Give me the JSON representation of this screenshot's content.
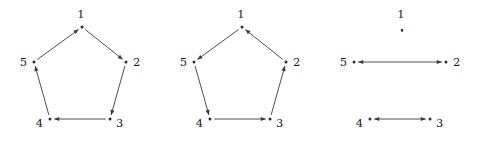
{
  "figure": {
    "width": 481,
    "height": 152,
    "background": "#ffffff",
    "ink_color": "#3a3a3a",
    "label_color": "#1a1a1a"
  },
  "panels": [
    {
      "id": "panel-left",
      "name": "directed-cycle-forward",
      "x": 0,
      "nodes": [
        {
          "id": "1",
          "label": "1",
          "cx": 82,
          "cy": 27,
          "label_dx": -1,
          "label_dy": -12,
          "anchor": "middle"
        },
        {
          "id": "2",
          "label": "2",
          "cx": 126,
          "cy": 62,
          "label_dx": 7,
          "label_dy": 1,
          "anchor": "start"
        },
        {
          "id": "3",
          "label": "3",
          "cx": 110,
          "cy": 119,
          "label_dx": 6,
          "label_dy": 5,
          "anchor": "start"
        },
        {
          "id": "4",
          "label": "4",
          "cx": 50,
          "cy": 119,
          "label_dx": -7,
          "label_dy": 5,
          "anchor": "end"
        },
        {
          "id": "5",
          "label": "5",
          "cx": 34,
          "cy": 62,
          "label_dx": -7,
          "label_dy": 1,
          "anchor": "end"
        }
      ],
      "edges": [
        {
          "from": "1",
          "to": "2",
          "arrow_at": "to"
        },
        {
          "from": "2",
          "to": "3",
          "arrow_at": "to"
        },
        {
          "from": "3",
          "to": "4",
          "arrow_at": "to"
        },
        {
          "from": "4",
          "to": "5",
          "arrow_at": "to"
        },
        {
          "from": "5",
          "to": "1",
          "arrow_at": "to"
        }
      ]
    },
    {
      "id": "panel-middle",
      "name": "directed-cycle-reverse",
      "x": 160,
      "nodes": [
        {
          "id": "1",
          "label": "1",
          "cx": 82,
          "cy": 27,
          "label_dx": -1,
          "label_dy": -12,
          "anchor": "middle"
        },
        {
          "id": "2",
          "label": "2",
          "cx": 126,
          "cy": 62,
          "label_dx": 7,
          "label_dy": 1,
          "anchor": "start"
        },
        {
          "id": "3",
          "label": "3",
          "cx": 110,
          "cy": 119,
          "label_dx": 6,
          "label_dy": 5,
          "anchor": "start"
        },
        {
          "id": "4",
          "label": "4",
          "cx": 50,
          "cy": 119,
          "label_dx": -7,
          "label_dy": 5,
          "anchor": "end"
        },
        {
          "id": "5",
          "label": "5",
          "cx": 34,
          "cy": 62,
          "label_dx": -7,
          "label_dy": 1,
          "anchor": "end"
        }
      ],
      "edges": [
        {
          "from": "1",
          "to": "5",
          "arrow_at": "to"
        },
        {
          "from": "5",
          "to": "4",
          "arrow_at": "to"
        },
        {
          "from": "4",
          "to": "3",
          "arrow_at": "to"
        },
        {
          "from": "3",
          "to": "2",
          "arrow_at": "to"
        },
        {
          "from": "2",
          "to": "1",
          "arrow_at": "to"
        }
      ]
    },
    {
      "id": "panel-right",
      "name": "two-bidirectional-edges",
      "x": 320,
      "nodes": [
        {
          "id": "1",
          "label": "1",
          "cx": 82,
          "cy": 27,
          "label_dx": -1,
          "label_dy": -12,
          "anchor": "middle"
        },
        {
          "id": "2",
          "label": "2",
          "cx": 126,
          "cy": 62,
          "label_dx": 7,
          "label_dy": 1,
          "anchor": "start"
        },
        {
          "id": "3",
          "label": "3",
          "cx": 110,
          "cy": 119,
          "label_dx": 6,
          "label_dy": 5,
          "anchor": "start"
        },
        {
          "id": "4",
          "label": "4",
          "cx": 50,
          "cy": 119,
          "label_dx": -7,
          "label_dy": 5,
          "anchor": "end"
        },
        {
          "id": "5",
          "label": "5",
          "cx": 34,
          "cy": 62,
          "label_dx": -7,
          "label_dy": 1,
          "anchor": "end"
        }
      ],
      "edges": [
        {
          "from": "5",
          "to": "2",
          "arrow_at": "both"
        },
        {
          "from": "4",
          "to": "3",
          "arrow_at": "both"
        }
      ]
    }
  ]
}
